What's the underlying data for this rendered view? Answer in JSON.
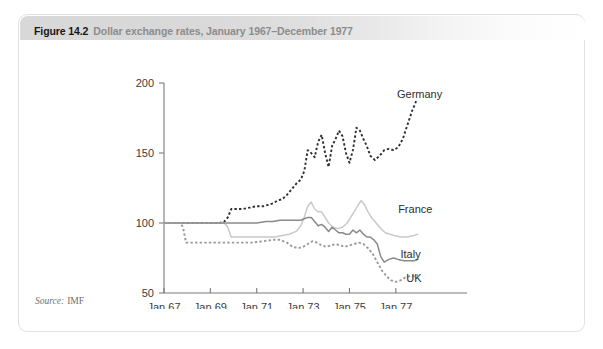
{
  "figure": {
    "number": "Figure 14.2",
    "caption": "Dollar exchange rates, January 1967–December 1977",
    "source_label": "Source:",
    "source_value": "IMF"
  },
  "chart_data": {
    "type": "line",
    "title": "Dollar exchange rates, January 1967–December 1977",
    "xlabel": "",
    "ylabel": "",
    "xlim": [
      1967.0,
      1978.0
    ],
    "ylim": [
      50,
      200
    ],
    "grid": false,
    "legend_position": "inline-right",
    "x_ticks": [
      1967,
      1969,
      1971,
      1973,
      1975,
      1977
    ],
    "x_tick_labels": [
      "Jan 67",
      "Jan 69",
      "Jan 71",
      "Jan 73",
      "Jan 75",
      "Jan 77"
    ],
    "y_ticks": [
      50,
      100,
      150,
      200
    ],
    "y_tick_labels": [
      "50",
      "100",
      "150",
      "200"
    ],
    "colors": {
      "germany": "#2f2f2f",
      "france": "#c9c9c9",
      "italy": "#8a8a8a",
      "uk": "#9a9a9a",
      "axis": "#7a7a7a",
      "text": "#3b3b3b",
      "header_gray": "#d8d8d8",
      "caption_gray": "#8c8c8c"
    },
    "series": [
      {
        "name": "Germany",
        "label": "Germany",
        "style": "dashed",
        "color": "#2f2f2f",
        "label_x": 1977.05,
        "label_y": 192,
        "x": [
          1967.0,
          1967.5,
          1968.0,
          1968.5,
          1969.0,
          1969.4,
          1969.6,
          1969.75,
          1969.9,
          1970.1,
          1970.4,
          1970.7,
          1971.0,
          1971.3,
          1971.5,
          1971.7,
          1971.9,
          1972.1,
          1972.3,
          1972.5,
          1972.7,
          1972.9,
          1973.05,
          1973.2,
          1973.35,
          1973.5,
          1973.65,
          1973.8,
          1973.95,
          1974.1,
          1974.25,
          1974.4,
          1974.55,
          1974.7,
          1974.85,
          1975.0,
          1975.15,
          1975.3,
          1975.45,
          1975.6,
          1975.75,
          1975.9,
          1976.1,
          1976.3,
          1976.5,
          1976.7,
          1976.9,
          1977.1,
          1977.3,
          1977.5,
          1977.7,
          1977.9
        ],
        "y": [
          100,
          100,
          100,
          100,
          100,
          100,
          101,
          104,
          110,
          110,
          110,
          111,
          112,
          112,
          113,
          114,
          116,
          117,
          120,
          124,
          128,
          131,
          137,
          152,
          150,
          147,
          158,
          163,
          150,
          140,
          155,
          160,
          166,
          162,
          150,
          143,
          152,
          168,
          166,
          160,
          155,
          148,
          145,
          148,
          152,
          153,
          152,
          154,
          160,
          170,
          180,
          188
        ]
      },
      {
        "name": "France",
        "label": "France",
        "style": "solid",
        "color": "#c9c9c9",
        "label_x": 1977.1,
        "label_y": 110,
        "x": [
          1967.0,
          1967.5,
          1968.0,
          1968.5,
          1969.0,
          1969.4,
          1969.6,
          1969.75,
          1969.9,
          1970.2,
          1970.6,
          1971.0,
          1971.4,
          1971.8,
          1972.1,
          1972.4,
          1972.7,
          1972.9,
          1973.05,
          1973.2,
          1973.35,
          1973.5,
          1973.65,
          1973.8,
          1973.95,
          1974.1,
          1974.3,
          1974.5,
          1974.7,
          1974.9,
          1975.05,
          1975.2,
          1975.35,
          1975.5,
          1975.65,
          1975.8,
          1975.95,
          1976.15,
          1976.35,
          1976.55,
          1976.75,
          1976.95,
          1977.2,
          1977.5,
          1977.75,
          1977.95
        ],
        "y": [
          100,
          100,
          100,
          100,
          100,
          100,
          100,
          97,
          90,
          90,
          90,
          90,
          90,
          90,
          91,
          92,
          94,
          98,
          104,
          112,
          115,
          110,
          108,
          108,
          104,
          100,
          97,
          96,
          97,
          100,
          104,
          108,
          112,
          116,
          113,
          108,
          104,
          100,
          96,
          93,
          92,
          91,
          90,
          90,
          91,
          92
        ]
      },
      {
        "name": "Italy",
        "label": "Italy",
        "style": "solid",
        "color": "#8a8a8a",
        "label_x": 1977.2,
        "label_y": 78,
        "x": [
          1967.0,
          1967.5,
          1968.0,
          1968.5,
          1969.0,
          1969.5,
          1970.0,
          1970.5,
          1971.0,
          1971.4,
          1971.7,
          1972.0,
          1972.3,
          1972.6,
          1972.9,
          1973.05,
          1973.2,
          1973.35,
          1973.5,
          1973.65,
          1973.8,
          1973.95,
          1974.1,
          1974.25,
          1974.4,
          1974.55,
          1974.7,
          1974.85,
          1975.0,
          1975.15,
          1975.3,
          1975.45,
          1975.6,
          1975.75,
          1975.9,
          1976.05,
          1976.2,
          1976.35,
          1976.5,
          1976.7,
          1976.9,
          1977.1,
          1977.35,
          1977.6,
          1977.8,
          1977.95
        ],
        "y": [
          100,
          100,
          100,
          100,
          100,
          100,
          100,
          100,
          100,
          101,
          101,
          102,
          102,
          102,
          102,
          103,
          104,
          104,
          101,
          98,
          99,
          97,
          94,
          97,
          95,
          93,
          93,
          92,
          92,
          95,
          93,
          95,
          92,
          90,
          90,
          88,
          85,
          76,
          72,
          74,
          75,
          74,
          73,
          73,
          73,
          74
        ]
      },
      {
        "name": "UK",
        "label": "UK",
        "style": "dashed",
        "color": "#9a9a9a",
        "label_x": 1977.45,
        "label_y": 61,
        "x": [
          1967.0,
          1967.4,
          1967.7,
          1967.82,
          1967.95,
          1968.3,
          1968.8,
          1969.3,
          1969.8,
          1970.3,
          1970.8,
          1971.3,
          1971.7,
          1972.0,
          1972.3,
          1972.55,
          1972.8,
          1973.0,
          1973.2,
          1973.4,
          1973.6,
          1973.8,
          1974.0,
          1974.2,
          1974.4,
          1974.6,
          1974.8,
          1975.0,
          1975.2,
          1975.4,
          1975.6,
          1975.8,
          1976.0,
          1976.2,
          1976.4,
          1976.6,
          1976.8,
          1977.0,
          1977.2,
          1977.4,
          1977.6,
          1977.8,
          1977.95
        ],
        "y": [
          100,
          100,
          100,
          97,
          86,
          86,
          86,
          86,
          86,
          86,
          86,
          87,
          88,
          88,
          86,
          83,
          82,
          83,
          85,
          87,
          86,
          84,
          83,
          84,
          85,
          84,
          83,
          84,
          85,
          86,
          85,
          82,
          78,
          72,
          66,
          62,
          59,
          58,
          59,
          61,
          62,
          62,
          63
        ]
      }
    ]
  }
}
